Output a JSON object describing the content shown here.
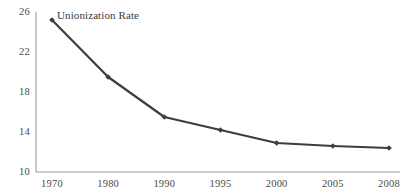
{
  "chart_data": {
    "type": "line",
    "title": "",
    "annotations": [
      {
        "text": "Unionization Rate",
        "x_px": 57,
        "y_px": 10
      }
    ],
    "categories": [
      "1970",
      "1980",
      "1990",
      "1995",
      "2000",
      "2005",
      "2008"
    ],
    "series": [
      {
        "name": "Unionization Rate",
        "values": [
          25.2,
          19.5,
          15.5,
          14.2,
          12.9,
          12.6,
          12.4
        ],
        "color": "#3d3d3d",
        "marker": "diamond",
        "line_width": 2.2
      }
    ],
    "xlabel": "",
    "ylabel": "",
    "ylim": [
      10,
      26
    ],
    "yticks": [
      10,
      14,
      18,
      22,
      26
    ],
    "ytick_labels": [
      "10",
      "14",
      "18",
      "22",
      "26"
    ],
    "xtick_labels": [
      "1970",
      "1980",
      "1990",
      "1995",
      "2000",
      "2005",
      "2008"
    ],
    "grid": false,
    "legend": false,
    "axis_color": "#9a9a9a",
    "background": "#ffffff"
  },
  "layout": {
    "plot_left": 36,
    "plot_right": 400,
    "plot_top": 12,
    "plot_bottom": 172
  }
}
